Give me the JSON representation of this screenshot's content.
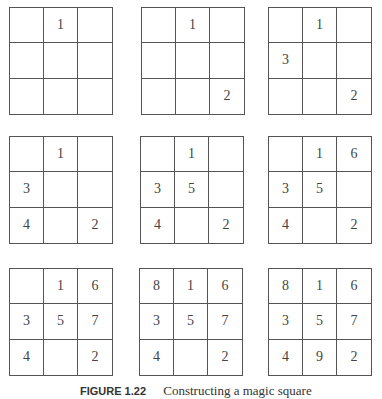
{
  "figure": {
    "grids": [
      {
        "cells": [
          "",
          "1",
          "",
          "",
          "",
          "",
          "",
          "",
          ""
        ]
      },
      {
        "cells": [
          "",
          "1",
          "",
          "",
          "",
          "",
          "",
          "",
          "2"
        ]
      },
      {
        "cells": [
          "",
          "1",
          "",
          "3",
          "",
          "",
          "",
          "",
          "2"
        ]
      },
      {
        "cells": [
          "",
          "1",
          "",
          "3",
          "",
          "",
          "4",
          "",
          "2"
        ]
      },
      {
        "cells": [
          "",
          "1",
          "",
          "3",
          "5",
          "",
          "4",
          "",
          "2"
        ]
      },
      {
        "cells": [
          "",
          "1",
          "6",
          "3",
          "5",
          "",
          "4",
          "",
          "2"
        ]
      },
      {
        "cells": [
          "",
          "1",
          "6",
          "3",
          "5",
          "7",
          "4",
          "",
          "2"
        ]
      },
      {
        "cells": [
          "8",
          "1",
          "6",
          "3",
          "5",
          "7",
          "4",
          "",
          "2"
        ]
      },
      {
        "cells": [
          "8",
          "1",
          "6",
          "3",
          "5",
          "7",
          "4",
          "9",
          "2"
        ]
      }
    ],
    "caption_label": "FIGURE 1.22",
    "caption_text": "Constructing a magic square"
  }
}
